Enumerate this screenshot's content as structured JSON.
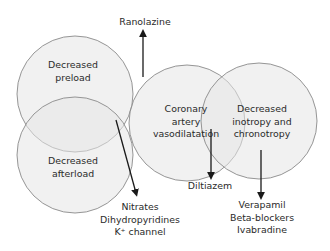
{
  "diagram": {
    "type": "venn",
    "colors": {
      "circle_fill": "#e6e6e6",
      "circle_stroke": "#8a8a8a",
      "arrow": "#1a1a1a",
      "text": "#2a2a2a"
    },
    "circles": [
      {
        "id": "preload",
        "label_lines": [
          "Decreased",
          "preload"
        ]
      },
      {
        "id": "afterload",
        "label_lines": [
          "Decreased",
          "afterload"
        ]
      },
      {
        "id": "coronary",
        "label_lines": [
          "Coronary",
          "artery",
          "vasodilatation"
        ]
      },
      {
        "id": "inotropy",
        "label_lines": [
          "Decreased",
          "inotropy and",
          "chronotropy"
        ]
      }
    ],
    "drug_labels": [
      {
        "id": "ranolazine",
        "lines": [
          "Ranolazine"
        ]
      },
      {
        "id": "nitrates-group",
        "lines": [
          "Nitrates",
          "Dihydropyridines",
          "K⁺ channel"
        ]
      },
      {
        "id": "diltiazem",
        "lines": [
          "Diltiazem"
        ]
      },
      {
        "id": "verapamil-group",
        "lines": [
          "Verapamil",
          "Beta-blockers",
          "Ivabradine"
        ]
      }
    ]
  }
}
